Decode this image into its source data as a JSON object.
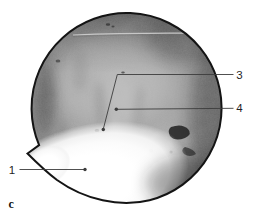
{
  "figure": {
    "panel_letter": "c",
    "callouts": [
      {
        "label": "1"
      },
      {
        "label": "3"
      },
      {
        "label": "4"
      }
    ]
  },
  "colors": {
    "background": "#ffffff",
    "outline": "#141414",
    "annotation_line": "#3c3c3c",
    "label_text": "#1f1f1f",
    "tissue_gray": "#9c9c9c",
    "bone_white": "#ffffff"
  }
}
